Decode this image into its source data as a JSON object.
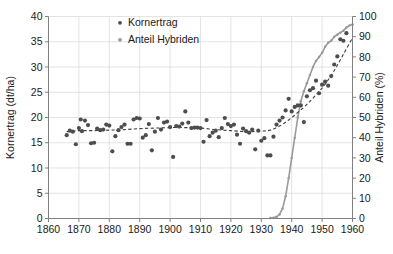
{
  "chart_data": {
    "type": "scatter",
    "title": "",
    "xlabel": "",
    "ylabel": "Kornertrag (dt/ha)",
    "y2label": "Anteil Hybriden (%)",
    "xlim": [
      1860,
      1960
    ],
    "ylim": [
      0,
      40
    ],
    "y2lim": [
      0,
      100
    ],
    "xticks": [
      1860,
      1870,
      1880,
      1890,
      1900,
      1910,
      1920,
      1930,
      1940,
      1950,
      1960
    ],
    "yticks": [
      0,
      5,
      10,
      15,
      20,
      25,
      30,
      35,
      40
    ],
    "y2ticks": [
      0,
      10,
      20,
      30,
      40,
      50,
      60,
      70,
      80,
      90,
      100
    ],
    "grid": true,
    "legend_position": "top-center",
    "series": [
      {
        "name": "Kornertrag",
        "type": "scatter",
        "axis": "left",
        "unit": "dt/ha",
        "color": "#4d4d4d",
        "points": [
          [
            1866,
            16.5
          ],
          [
            1867,
            17.4
          ],
          [
            1868,
            17.2
          ],
          [
            1869,
            14.7
          ],
          [
            1870,
            17.9
          ],
          [
            1870.6,
            19.6
          ],
          [
            1871,
            17.3
          ],
          [
            1872,
            19.4
          ],
          [
            1873,
            18.5
          ],
          [
            1874,
            14.9
          ],
          [
            1875,
            15.0
          ],
          [
            1876,
            17.8
          ],
          [
            1877,
            17.5
          ],
          [
            1878,
            17.6
          ],
          [
            1879,
            18.6
          ],
          [
            1880,
            18.4
          ],
          [
            1881,
            13.3
          ],
          [
            1882,
            16.3
          ],
          [
            1883,
            17.5
          ],
          [
            1884,
            18.1
          ],
          [
            1885,
            18.6
          ],
          [
            1886,
            14.8
          ],
          [
            1887,
            14.8
          ],
          [
            1888,
            19.6
          ],
          [
            1889,
            19.9
          ],
          [
            1890,
            19.8
          ],
          [
            1891,
            16.0
          ],
          [
            1892,
            16.5
          ],
          [
            1893,
            18.7
          ],
          [
            1894,
            13.5
          ],
          [
            1895,
            17.2
          ],
          [
            1896,
            19.9
          ],
          [
            1897,
            17.6
          ],
          [
            1898,
            19.0
          ],
          [
            1899,
            19.2
          ],
          [
            1900,
            18.1
          ],
          [
            1901,
            12.2
          ],
          [
            1902,
            18.3
          ],
          [
            1903,
            18.2
          ],
          [
            1904,
            18.8
          ],
          [
            1905,
            21.2
          ],
          [
            1906,
            19.0
          ],
          [
            1907,
            17.9
          ],
          [
            1908,
            18.0
          ],
          [
            1909,
            18.0
          ],
          [
            1910,
            17.9
          ],
          [
            1911,
            15.2
          ],
          [
            1912,
            19.5
          ],
          [
            1913,
            16.3
          ],
          [
            1914,
            17.0
          ],
          [
            1915,
            17.4
          ],
          [
            1916,
            16.1
          ],
          [
            1917,
            17.9
          ],
          [
            1918,
            19.9
          ],
          [
            1919,
            18.7
          ],
          [
            1920,
            18.3
          ],
          [
            1921,
            18.6
          ],
          [
            1922,
            16.6
          ],
          [
            1923,
            14.8
          ],
          [
            1924,
            17.8
          ],
          [
            1925,
            17.3
          ],
          [
            1926,
            17.0
          ],
          [
            1927,
            17.6
          ],
          [
            1928,
            13.7
          ],
          [
            1929,
            17.4
          ],
          [
            1930,
            15.4
          ],
          [
            1931,
            15.9
          ],
          [
            1932,
            12.5
          ],
          [
            1933,
            12.5
          ],
          [
            1934,
            16.2
          ],
          [
            1935,
            18.6
          ],
          [
            1936,
            19.4
          ],
          [
            1937,
            20.0
          ],
          [
            1938,
            21.4
          ],
          [
            1939,
            23.7
          ],
          [
            1940,
            21.2
          ],
          [
            1941,
            22.1
          ],
          [
            1942,
            22.4
          ],
          [
            1943,
            22.4
          ],
          [
            1944,
            19.1
          ],
          [
            1945,
            24.2
          ],
          [
            1946,
            25.4
          ],
          [
            1947,
            25.8
          ],
          [
            1948,
            27.3
          ],
          [
            1949,
            24.8
          ],
          [
            1950,
            26.5
          ],
          [
            1951,
            27.1
          ],
          [
            1952,
            26.3
          ],
          [
            1953,
            28.2
          ],
          [
            1954,
            30.5
          ],
          [
            1955,
            32.1
          ],
          [
            1956,
            35.5
          ],
          [
            1957,
            35.2
          ],
          [
            1958,
            36.7
          ]
        ]
      },
      {
        "name": "Kornertrag Trend",
        "type": "line",
        "style": "dashed",
        "axis": "left",
        "color": "#3d3d3d",
        "points": [
          [
            1866,
            17.2
          ],
          [
            1870,
            17.4
          ],
          [
            1875,
            17.4
          ],
          [
            1880,
            17.5
          ],
          [
            1885,
            17.6
          ],
          [
            1890,
            17.8
          ],
          [
            1895,
            17.9
          ],
          [
            1900,
            18.0
          ],
          [
            1905,
            18.0
          ],
          [
            1910,
            17.9
          ],
          [
            1915,
            17.6
          ],
          [
            1920,
            17.4
          ],
          [
            1925,
            17.2
          ],
          [
            1930,
            17.3
          ],
          [
            1933,
            17.5
          ],
          [
            1936,
            18.3
          ],
          [
            1939,
            19.5
          ],
          [
            1942,
            21.0
          ],
          [
            1945,
            22.6
          ],
          [
            1948,
            24.5
          ],
          [
            1951,
            26.6
          ],
          [
            1954,
            29.3
          ],
          [
            1957,
            32.5
          ],
          [
            1960,
            35.8
          ]
        ]
      },
      {
        "name": "Anteil Hybriden",
        "type": "line",
        "axis": "right",
        "unit": "%",
        "color": "#9a9a9a",
        "points": [
          [
            1933,
            0.2
          ],
          [
            1934,
            0.4
          ],
          [
            1935,
            0.8
          ],
          [
            1936,
            2.0
          ],
          [
            1937,
            5.0
          ],
          [
            1938,
            11.0
          ],
          [
            1939,
            20.0
          ],
          [
            1940,
            30.0
          ],
          [
            1941,
            40.0
          ],
          [
            1942,
            50.0
          ],
          [
            1943,
            58.0
          ],
          [
            1944,
            63.0
          ],
          [
            1945,
            67.0
          ],
          [
            1946,
            71.0
          ],
          [
            1947,
            75.0
          ],
          [
            1948,
            78.0
          ],
          [
            1949,
            80.0
          ],
          [
            1950,
            82.0
          ],
          [
            1951,
            85.0
          ],
          [
            1952,
            87.0
          ],
          [
            1953,
            88.0
          ],
          [
            1954,
            90.0
          ],
          [
            1955,
            91.0
          ],
          [
            1956,
            92.0
          ],
          [
            1957,
            93.0
          ],
          [
            1958,
            94.5
          ],
          [
            1959,
            95.5
          ],
          [
            1960,
            96.0
          ]
        ]
      }
    ],
    "legend": [
      {
        "label": "Kornertrag",
        "marker": "dot",
        "color": "#4d4d4d"
      },
      {
        "label": "Anteil Hybriden",
        "marker": "dot",
        "color": "#9a9a9a"
      }
    ]
  }
}
